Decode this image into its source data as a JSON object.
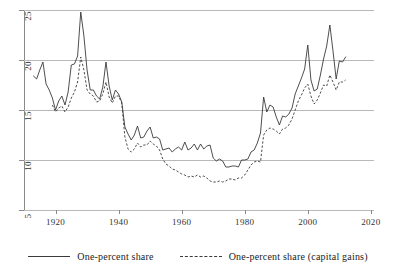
{
  "chart_data": {
    "type": "line",
    "title": "",
    "subtitle": "",
    "xlabel": "",
    "ylabel": "",
    "xlim": [
      1910,
      2021
    ],
    "ylim": [
      5,
      25
    ],
    "xticks": [
      1920,
      1940,
      1960,
      1980,
      2000,
      2020
    ],
    "yticks": [
      5,
      10,
      15,
      20,
      25
    ],
    "grid": "horizontal",
    "legend_position": "bottom-center",
    "series": [
      {
        "name": "One-percent share",
        "style": "solid",
        "color": "#3a3a3a",
        "x": [
          1913,
          1914,
          1915,
          1916,
          1917,
          1918,
          1919,
          1920,
          1921,
          1922,
          1923,
          1924,
          1925,
          1926,
          1927,
          1928,
          1929,
          1930,
          1931,
          1932,
          1933,
          1934,
          1935,
          1936,
          1937,
          1938,
          1939,
          1940,
          1941,
          1942,
          1943,
          1944,
          1945,
          1946,
          1947,
          1948,
          1949,
          1950,
          1951,
          1952,
          1953,
          1954,
          1955,
          1956,
          1957,
          1958,
          1959,
          1960,
          1961,
          1962,
          1963,
          1964,
          1965,
          1966,
          1967,
          1968,
          1969,
          1970,
          1971,
          1972,
          1973,
          1974,
          1975,
          1976,
          1977,
          1978,
          1979,
          1980,
          1981,
          1982,
          1983,
          1984,
          1985,
          1986,
          1987,
          1988,
          1989,
          1990,
          1991,
          1992,
          1993,
          1994,
          1995,
          1996,
          1997,
          1998,
          1999,
          2000,
          2001,
          2002,
          2003,
          2004,
          2005,
          2006,
          2007,
          2008,
          2009,
          2010,
          2011,
          2012
        ],
        "values": [
          18.4,
          18.1,
          19.0,
          19.8,
          17.6,
          17.0,
          16.2,
          15.0,
          15.9,
          16.4,
          15.5,
          16.8,
          19.5,
          19.6,
          20.4,
          24.8,
          22.4,
          19.0,
          17.0,
          17.0,
          16.4,
          16.1,
          17.3,
          19.8,
          17.4,
          16.0,
          17.0,
          16.6,
          15.8,
          13.3,
          12.6,
          12.0,
          12.5,
          13.4,
          12.2,
          12.3,
          12.9,
          13.3,
          12.2,
          12.3,
          12.1,
          11.0,
          11.1,
          11.2,
          10.8,
          11.1,
          11.3,
          11.0,
          11.8,
          11.0,
          11.2,
          11.6,
          11.0,
          11.6,
          11.1,
          11.4,
          11.5,
          10.2,
          9.9,
          10.1,
          9.9,
          9.3,
          9.3,
          9.4,
          9.4,
          9.3,
          10.0,
          10.0,
          10.1,
          10.8,
          11.0,
          11.7,
          12.7,
          16.3,
          14.8,
          15.5,
          15.3,
          14.3,
          13.5,
          14.4,
          14.3,
          14.6,
          15.2,
          16.6,
          17.4,
          18.2,
          19.1,
          21.5,
          18.0,
          16.9,
          17.1,
          18.5,
          20.1,
          21.4,
          23.5,
          20.9,
          18.1,
          19.9,
          19.8,
          20.3
        ]
      },
      {
        "name": "One-percent share (capital gains)",
        "style": "dashed",
        "color": "#3a3a3a",
        "x": [
          1919,
          1920,
          1921,
          1922,
          1923,
          1924,
          1925,
          1926,
          1927,
          1928,
          1929,
          1930,
          1931,
          1932,
          1933,
          1934,
          1935,
          1936,
          1937,
          1938,
          1939,
          1940,
          1941,
          1942,
          1943,
          1944,
          1945,
          1946,
          1947,
          1948,
          1949,
          1950,
          1951,
          1952,
          1953,
          1954,
          1955,
          1956,
          1957,
          1958,
          1959,
          1960,
          1961,
          1962,
          1963,
          1964,
          1965,
          1966,
          1967,
          1968,
          1969,
          1970,
          1971,
          1972,
          1973,
          1974,
          1975,
          1976,
          1977,
          1978,
          1979,
          1980,
          1981,
          1982,
          1983,
          1984,
          1985,
          1986,
          1987,
          1988,
          1989,
          1990,
          1991,
          1992,
          1993,
          1994,
          1995,
          1996,
          1997,
          1998,
          1999,
          2000,
          2001,
          2002,
          2003,
          2004,
          2005,
          2006,
          2007,
          2008,
          2009,
          2010,
          2011,
          2012
        ],
        "values": [
          15.5,
          14.8,
          15.2,
          15.4,
          14.8,
          15.3,
          16.2,
          16.8,
          17.8,
          20.3,
          19.0,
          17.0,
          16.6,
          16.4,
          15.8,
          15.9,
          16.6,
          17.8,
          16.3,
          15.7,
          16.4,
          16.4,
          15.7,
          12.3,
          11.1,
          10.8,
          11.1,
          11.7,
          11.3,
          11.5,
          11.5,
          11.9,
          11.6,
          11.4,
          11.0,
          10.1,
          9.6,
          9.4,
          9.1,
          9.0,
          8.8,
          8.6,
          8.5,
          8.3,
          8.4,
          8.3,
          8.5,
          8.3,
          8.4,
          8.2,
          7.9,
          7.8,
          7.8,
          7.9,
          7.8,
          7.9,
          8.1,
          8.1,
          8.0,
          8.2,
          8.2,
          8.5,
          9.0,
          9.5,
          9.8,
          9.9,
          9.8,
          12.5,
          13.0,
          13.2,
          13.1,
          12.9,
          12.6,
          13.1,
          13.2,
          13.5,
          14.1,
          15.0,
          15.9,
          16.5,
          17.2,
          17.6,
          16.4,
          15.6,
          16.0,
          16.7,
          17.5,
          17.4,
          18.5,
          17.8,
          17.0,
          17.8,
          17.8,
          18.0
        ]
      }
    ]
  },
  "axes": {
    "y_tick_labels": [
      "5",
      "10",
      "15",
      "20",
      "25"
    ],
    "x_tick_labels": [
      "1920",
      "1940",
      "1960",
      "1980",
      "2000",
      "2020"
    ]
  },
  "legend": {
    "items": [
      {
        "label": "One-percent share",
        "style": "solid"
      },
      {
        "label": "One-percent share (capital gains)",
        "style": "dashed"
      }
    ]
  },
  "colors": {
    "line": "#3a3a3a",
    "grid": "#b9b9b9",
    "axis": "#8a8a8a",
    "text": "#2b2b2b",
    "background": "#ffffff"
  }
}
